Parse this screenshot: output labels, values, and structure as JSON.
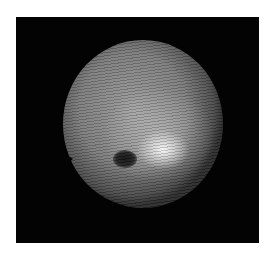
{
  "image": {
    "description": "Grayscale circular specimen image with horizontal scan-line texture on black background",
    "background_color": "#030303",
    "frame_color": "#ffffff",
    "features": [
      "bright-region",
      "dark-spot",
      "left-notch"
    ]
  }
}
